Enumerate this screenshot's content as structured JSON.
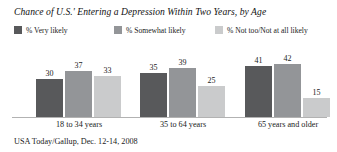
{
  "chart_data": {
    "type": "bar",
    "title": "Chance of U.S.' Entering a Depression Within Two Years, by Age",
    "categories": [
      "18 to 34 years",
      "35 to 64 years",
      "65 years and older"
    ],
    "series": [
      {
        "name": "% Very likely",
        "color": "#58595b",
        "values": [
          30,
          35,
          41
        ]
      },
      {
        "name": "% Somewhat likely",
        "color": "#939598",
        "values": [
          37,
          39,
          42
        ]
      },
      {
        "name": "% Not too/Not at all likely",
        "color": "#cacbcc",
        "values": [
          33,
          25,
          15
        ]
      }
    ],
    "xlabel": "",
    "ylabel": "",
    "ylim": [
      0,
      60
    ],
    "grid": false,
    "legend_position": "top",
    "source": "USA Today/Gallup, Dec. 12-14, 2008",
    "axis_color": "#b2b2b2",
    "background": "#ffffff"
  }
}
